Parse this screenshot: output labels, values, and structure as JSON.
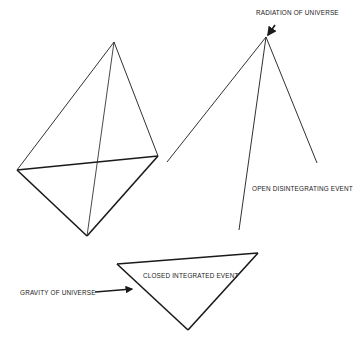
{
  "labels": {
    "radiation": "RADIATION OF UNIVERSE",
    "open_event": "OPEN DISINTEGRATING EVENT",
    "closed_event": "CLOSED INTEGRATED EVENT",
    "gravity": "GRAVITY OF UNIVERSE"
  },
  "colors": {
    "line": "#1a1a1a",
    "background": "#ffffff"
  }
}
